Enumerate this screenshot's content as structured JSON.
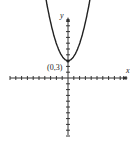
{
  "chart_data": {
    "type": "line",
    "title": "",
    "equation_shape": "parabola opening upward",
    "xlabel": "x",
    "ylabel": "y",
    "xlim": [
      -10,
      10
    ],
    "ylim": [
      -10,
      10
    ],
    "grid": false,
    "series": [
      {
        "name": "parabola",
        "x": [
          -2,
          -1.5,
          -1,
          -0.5,
          0,
          0.5,
          1,
          1.5,
          2
        ],
        "y": [
          11,
          7.5,
          5,
          3.5,
          3,
          3.5,
          5,
          7.5,
          11
        ]
      }
    ],
    "annotations": [
      {
        "text": "(0,3)",
        "x": 0,
        "y": 3
      }
    ]
  },
  "labels": {
    "x_axis": "x",
    "y_axis": "y",
    "vertex": "(0,3)"
  },
  "colors": {
    "axis": "#333333",
    "curve": "#222222"
  }
}
